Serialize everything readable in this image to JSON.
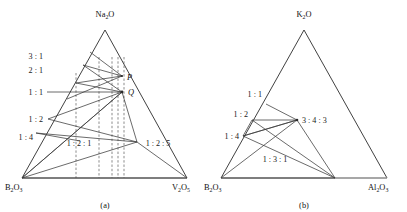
{
  "figure": {
    "panels": [
      {
        "id": "a",
        "caption": "(a)",
        "vertices": {
          "top": {
            "text": "Na",
            "sub1": "2",
            "tail": "O"
          },
          "bottom_left": {
            "text": "B",
            "sub1": "2",
            "mid": "O",
            "sub2": "3"
          },
          "bottom_right": {
            "text": "V",
            "sub1": "2",
            "mid": "O",
            "sub2": "5"
          }
        },
        "edge_labels": [
          "3 : 1",
          "2 : 1",
          "1 : 1",
          "1 : 2",
          "1 : 4"
        ],
        "interior_labels": [
          "1 : 2 : 1",
          "1 : 2 : 5"
        ],
        "point_labels": [
          "P",
          "Q"
        ]
      },
      {
        "id": "b",
        "caption": "(b)",
        "vertices": {
          "top": {
            "text": "K",
            "sub1": "2",
            "tail": "O"
          },
          "bottom_left": {
            "text": "B",
            "sub1": "2",
            "mid": "O",
            "sub2": "3"
          },
          "bottom_right": {
            "text": "Al",
            "sub1": "2",
            "mid": "O",
            "sub2": "3"
          }
        },
        "edge_labels": [
          "1 : 1",
          "1 : 2",
          "1 : 4"
        ],
        "interior_labels": [
          "3 : 4 : 3",
          "1 : 3 : 1"
        ]
      }
    ],
    "colors": {
      "line": "#2b2b2b",
      "base_line": "#8a8a8a",
      "dashed": "#5a5a5a",
      "text": "#111111",
      "background": "#ffffff"
    }
  }
}
